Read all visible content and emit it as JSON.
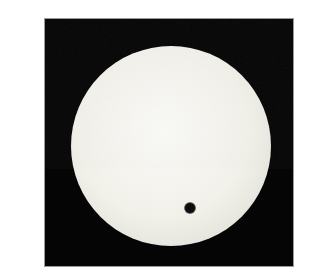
{
  "scene": {
    "alt": "Photograph of the Sun during a transit of Venus: a bright cream-white solar disk on a black sky, with Venus visible as a small dark dot on the lower-right part of the disk; the photo sits on a white margin with a thin gray edge line.",
    "colors": {
      "page_background": "#ffffff",
      "frame_border": "#9a9a9a",
      "sky": "#050505",
      "sun_center": "#fafaf7",
      "sun_mid": "#f1f0e9",
      "sun_outer": "#dcdbd3",
      "sun_limb": "#aaa9a3",
      "venus": "#0d0d0d"
    },
    "geometry": {
      "canvas": {
        "width": 264,
        "height": 259
      },
      "photo": {
        "left": 4,
        "top": 2,
        "width": 250,
        "height": 249,
        "border": 1
      },
      "sun": {
        "cx": 131,
        "cy": 130,
        "r": 100
      },
      "venus": {
        "cx": 150,
        "cy": 192,
        "r": 4,
        "halo": 6
      },
      "grain_opacity": 0.06
    }
  }
}
